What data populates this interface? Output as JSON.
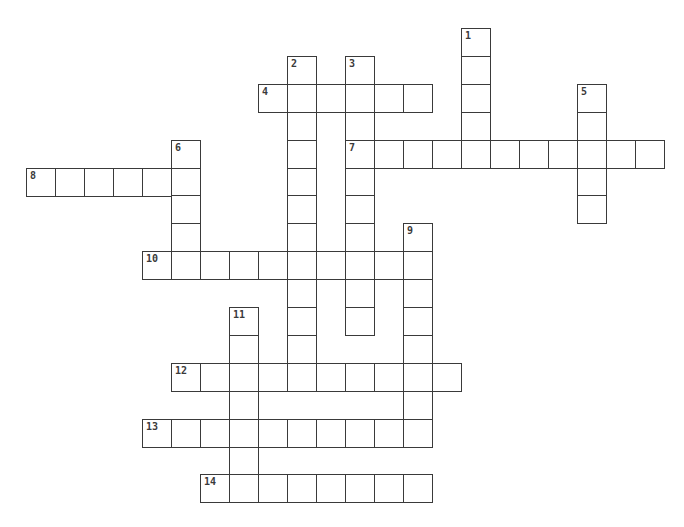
{
  "puzzle": {
    "grid": {
      "origin_x": 26,
      "origin_y": 28,
      "col_pitch": 29,
      "row_pitch": 27.9,
      "cell_w": 30,
      "cell_h": 29
    },
    "border_color": "#3a3a3a",
    "number_color": "#3a3a3a",
    "entries": [
      {
        "number": "1",
        "direction": "down",
        "row": 0,
        "col": 15,
        "length": 5
      },
      {
        "number": "2",
        "direction": "down",
        "row": 1,
        "col": 9,
        "length": 11
      },
      {
        "number": "3",
        "direction": "down",
        "row": 1,
        "col": 11,
        "length": 10
      },
      {
        "number": "4",
        "direction": "across",
        "row": 2,
        "col": 8,
        "length": 6
      },
      {
        "number": "5",
        "direction": "down",
        "row": 2,
        "col": 19,
        "length": 5
      },
      {
        "number": "6",
        "direction": "down",
        "row": 4,
        "col": 5,
        "length": 5
      },
      {
        "number": "7",
        "direction": "across",
        "row": 4,
        "col": 11,
        "length": 11
      },
      {
        "number": "8",
        "direction": "across",
        "row": 5,
        "col": 0,
        "length": 6
      },
      {
        "number": "9",
        "direction": "down",
        "row": 7,
        "col": 13,
        "length": 8
      },
      {
        "number": "10",
        "direction": "across",
        "row": 8,
        "col": 4,
        "length": 10
      },
      {
        "number": "11",
        "direction": "down",
        "row": 10,
        "col": 7,
        "length": 6
      },
      {
        "number": "12",
        "direction": "across",
        "row": 12,
        "col": 5,
        "length": 10
      },
      {
        "number": "13",
        "direction": "across",
        "row": 14,
        "col": 4,
        "length": 10
      },
      {
        "number": "14",
        "direction": "across",
        "row": 16,
        "col": 6,
        "length": 8
      }
    ]
  }
}
